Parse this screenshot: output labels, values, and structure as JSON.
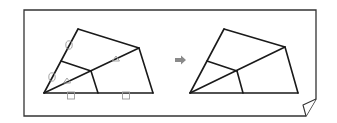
{
  "diagram": {
    "colors": {
      "line": "#1a1a1a",
      "frame": "#333333",
      "mark": "#9a9a9a",
      "arrow": "#8a8a8a",
      "background": "#ffffff"
    },
    "left_figure": {
      "vertices": {
        "A": [
          44,
          93
        ],
        "B": [
          78,
          29
        ],
        "C": [
          139,
          48
        ],
        "D": [
          153,
          93
        ],
        "E": [
          61,
          61
        ],
        "F": [
          91,
          71
        ],
        "G": [
          98,
          93
        ]
      },
      "marks": [
        {
          "type": "circle",
          "at": [
            69,
            45
          ]
        },
        {
          "type": "circle",
          "at": [
            52,
            77
          ]
        },
        {
          "type": "triangle",
          "at": [
            67,
            81
          ]
        },
        {
          "type": "triangle",
          "at": [
            116,
            59
          ]
        },
        {
          "type": "square",
          "at": [
            71,
            94
          ]
        },
        {
          "type": "square",
          "at": [
            126,
            94
          ]
        }
      ]
    },
    "arrow": {
      "icon": "right-arrow-icon",
      "at": [
        181,
        60
      ]
    },
    "right_figure": {
      "vertices": {
        "A": [
          190,
          93
        ],
        "B": [
          224,
          29
        ],
        "C": [
          285,
          47
        ],
        "D": [
          298,
          93
        ],
        "E": [
          207,
          61
        ],
        "F": [
          237,
          71
        ],
        "G": [
          243,
          93
        ]
      }
    },
    "frame": {
      "left": 24,
      "top": 10,
      "right": 316,
      "bottom": 116,
      "folded_corner": "bottom-right"
    }
  }
}
